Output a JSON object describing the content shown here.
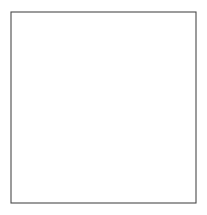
{
  "figure": {
    "name": "geometric-tiling-pattern",
    "kind": "line-drawing",
    "title": "",
    "caption": "",
    "width": 207,
    "height": 215,
    "background_color": "#ffffff"
  },
  "frame": {
    "name": "border-frame",
    "x": 11,
    "y": 12,
    "width": 185,
    "height": 191,
    "stroke_color": "#4a4a4a",
    "stroke_width": 1.1,
    "fill_color": "#ffffff"
  },
  "style": {
    "line_color": "#3d3d3d",
    "line_color_soft": "#6f6f6f",
    "line_width": 0.85,
    "shade_color": "#ececec",
    "node_color": "#2e2e2e",
    "node_radius": 0.9
  },
  "tiling": {
    "description": "Periodic tessellation of pentagonal stars, hexagons with radiating spokes, and triangles",
    "period_x": 61.7,
    "period_y": 61.7,
    "columns": 3,
    "rows": 3,
    "origin_x": 11,
    "origin_y": 12,
    "motifs": [
      "five-pointed-star",
      "hexagon-with-spokes",
      "triangle-fan",
      "kite"
    ]
  },
  "cells": [
    {
      "id": "r0c0",
      "motif": "five-pointed-star",
      "cx": 41.8,
      "cy": 42.8
    },
    {
      "id": "r0c1",
      "motif": "hexagon-with-spokes",
      "cx": 103.5,
      "cy": 42.8
    },
    {
      "id": "r0c2",
      "motif": "five-pointed-star",
      "cx": 165.2,
      "cy": 42.8
    },
    {
      "id": "r1c0",
      "motif": "hexagon-with-spokes",
      "cx": 41.8,
      "cy": 104.5
    },
    {
      "id": "r1c1",
      "motif": "hexagon-with-spokes",
      "cx": 103.5,
      "cy": 104.5
    },
    {
      "id": "r1c2",
      "motif": "hexagon-with-spokes",
      "cx": 165.2,
      "cy": 104.5
    },
    {
      "id": "r2c0",
      "motif": "hexagon-with-spokes",
      "cx": 41.8,
      "cy": 166.2
    },
    {
      "id": "r2c1",
      "motif": "triangle-fan",
      "cx": 103.5,
      "cy": 166.2
    },
    {
      "id": "r2c2",
      "motif": "hexagon-with-spokes",
      "cx": 165.2,
      "cy": 166.2
    }
  ],
  "vertical_guides": {
    "name": "vertical-accent-lines",
    "color": "#8a8a8a",
    "x_positions": [
      41.8,
      72.7,
      103.5,
      134.4,
      165.2
    ]
  }
}
